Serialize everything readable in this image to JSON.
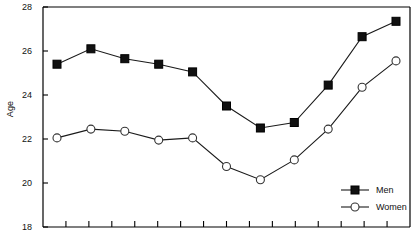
{
  "chart_data": {
    "type": "line",
    "title": "",
    "xlabel": "",
    "ylabel": "Age",
    "ylim": [
      18,
      28
    ],
    "yticks": [
      18,
      20,
      22,
      24,
      26,
      28
    ],
    "ytick_labels": [
      "18",
      "20",
      "22",
      "24",
      "26",
      "28"
    ],
    "xticks_count": 15,
    "xtick_labels": [],
    "grid": false,
    "legend_position": "bottom-right",
    "x": [
      1,
      2,
      3,
      4,
      5,
      6,
      7,
      8,
      9,
      10,
      11
    ],
    "series": [
      {
        "name": "Men",
        "marker": "filled-square",
        "color": "#000000",
        "values": [
          25.4,
          26.1,
          25.65,
          25.4,
          25.05,
          23.5,
          22.5,
          22.75,
          24.45,
          26.65,
          27.35
        ]
      },
      {
        "name": "Women",
        "marker": "open-circle",
        "color": "#000000",
        "values": [
          22.05,
          22.45,
          22.35,
          21.95,
          22.05,
          20.75,
          20.15,
          21.05,
          22.45,
          24.35,
          25.55
        ]
      }
    ]
  },
  "axis": {
    "label_y": "Age",
    "tick_0": "18",
    "tick_1": "20",
    "tick_2": "22",
    "tick_3": "24",
    "tick_4": "26",
    "tick_5": "28"
  },
  "legend": {
    "entries": [
      {
        "label": "Men",
        "marker": "filled-square"
      },
      {
        "label": "Women",
        "marker": "open-circle"
      }
    ],
    "men_label": "Men",
    "women_label": "Women"
  },
  "colors": {
    "line": "#1a1a1a",
    "axis": "#000000",
    "marker_fill": "#111111",
    "marker_open": "#ffffff",
    "background": "#ffffff"
  }
}
